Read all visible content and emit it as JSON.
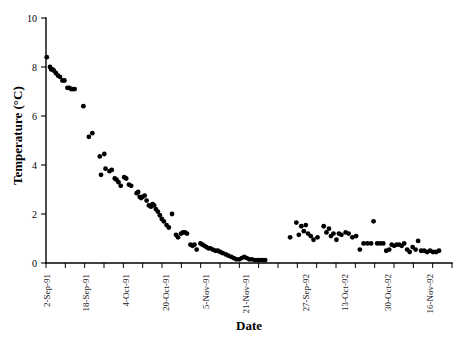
{
  "chart_data": {
    "type": "scatter",
    "title": "",
    "xlabel": "Date",
    "ylabel": "Temperature (°C)",
    "ylim": [
      0,
      10
    ],
    "yticks": [
      0,
      2,
      4,
      6,
      8,
      10
    ],
    "ytick_labels": [
      "0",
      "2",
      "4",
      "6",
      "8",
      "10"
    ],
    "grid": false,
    "legend": "none",
    "marker": "filled-circle",
    "marker_color": "#000000",
    "xtick_labels": [
      "2-Sep-91",
      "18-Sep-91",
      "4-Oct-91",
      "20-Oct-91",
      "5-Nov-91",
      "21-Nov-91",
      "27-Sep-92",
      "13-Oct-92",
      "30-Oct-92",
      "16-Nov-92"
    ],
    "xtick_positions": [
      0,
      16,
      32,
      48,
      64,
      80,
      104,
      120,
      137,
      154
    ],
    "xtick_minor_count": 21,
    "xaxis_note": "day index; gap between 1991 and 1992 sampling seasons",
    "series": [
      {
        "name": "Temperature",
        "points": [
          [
            0.3,
            8.4
          ],
          [
            1.6,
            8.0
          ],
          [
            2.1,
            7.9
          ],
          [
            2.6,
            7.9
          ],
          [
            3.2,
            7.85
          ],
          [
            4.0,
            7.75
          ],
          [
            4.8,
            7.65
          ],
          [
            5.6,
            7.6
          ],
          [
            6.6,
            7.45
          ],
          [
            7.4,
            7.45
          ],
          [
            8.6,
            7.15
          ],
          [
            9.4,
            7.15
          ],
          [
            10.1,
            7.1
          ],
          [
            10.8,
            7.1
          ],
          [
            11.5,
            7.1
          ],
          [
            15.0,
            6.4
          ],
          [
            17.2,
            5.15
          ],
          [
            18.6,
            5.3
          ],
          [
            21.6,
            4.35
          ],
          [
            23.4,
            4.45
          ],
          [
            23.9,
            3.85
          ],
          [
            22.1,
            3.6
          ],
          [
            25.5,
            3.75
          ],
          [
            26.4,
            3.8
          ],
          [
            27.6,
            3.45
          ],
          [
            28.3,
            3.4
          ],
          [
            29.1,
            3.3
          ],
          [
            30.0,
            3.15
          ],
          [
            31.4,
            3.5
          ],
          [
            32.2,
            3.45
          ],
          [
            33.3,
            3.2
          ],
          [
            34.2,
            3.15
          ],
          [
            36.4,
            2.85
          ],
          [
            37.0,
            2.9
          ],
          [
            37.6,
            2.7
          ],
          [
            38.2,
            2.65
          ],
          [
            38.8,
            2.7
          ],
          [
            39.6,
            2.75
          ],
          [
            40.4,
            2.55
          ],
          [
            41.3,
            2.35
          ],
          [
            42.1,
            2.3
          ],
          [
            42.8,
            2.4
          ],
          [
            43.4,
            2.35
          ],
          [
            44.1,
            2.2
          ],
          [
            44.9,
            2.1
          ],
          [
            45.7,
            1.95
          ],
          [
            46.5,
            1.8
          ],
          [
            47.3,
            1.7
          ],
          [
            48.4,
            1.55
          ],
          [
            49.3,
            1.45
          ],
          [
            50.6,
            2.0
          ],
          [
            52.2,
            1.15
          ],
          [
            53.0,
            1.05
          ],
          [
            54.2,
            1.2
          ],
          [
            55.0,
            1.25
          ],
          [
            55.8,
            1.25
          ],
          [
            56.6,
            1.2
          ],
          [
            58.0,
            0.75
          ],
          [
            58.8,
            0.7
          ],
          [
            59.6,
            0.75
          ],
          [
            60.5,
            0.55
          ],
          [
            62.0,
            0.8
          ],
          [
            62.8,
            0.75
          ],
          [
            63.6,
            0.7
          ],
          [
            64.4,
            0.65
          ],
          [
            65.2,
            0.6
          ],
          [
            66.0,
            0.6
          ],
          [
            67.0,
            0.55
          ],
          [
            68.0,
            0.5
          ],
          [
            69.0,
            0.5
          ],
          [
            70.0,
            0.45
          ],
          [
            71.0,
            0.4
          ],
          [
            72.2,
            0.35
          ],
          [
            73.2,
            0.3
          ],
          [
            74.4,
            0.25
          ],
          [
            75.4,
            0.2
          ],
          [
            76.4,
            0.15
          ],
          [
            77.6,
            0.15
          ],
          [
            78.6,
            0.2
          ],
          [
            79.6,
            0.25
          ],
          [
            80.6,
            0.2
          ],
          [
            81.6,
            0.15
          ],
          [
            82.6,
            0.15
          ],
          [
            83.8,
            0.12
          ],
          [
            85.0,
            0.12
          ],
          [
            86.0,
            0.12
          ],
          [
            87.0,
            0.12
          ],
          [
            88.0,
            0.12
          ],
          [
            98.0,
            1.05
          ],
          [
            100.5,
            1.65
          ],
          [
            101.5,
            1.15
          ],
          [
            102.5,
            1.5
          ],
          [
            103.5,
            1.3
          ],
          [
            104.3,
            1.55
          ],
          [
            105.2,
            1.2
          ],
          [
            106.3,
            1.1
          ],
          [
            107.4,
            0.95
          ],
          [
            109.0,
            1.05
          ],
          [
            111.5,
            1.5
          ],
          [
            112.6,
            1.25
          ],
          [
            113.6,
            1.4
          ],
          [
            114.4,
            1.1
          ],
          [
            115.4,
            1.2
          ],
          [
            116.6,
            0.95
          ],
          [
            117.6,
            1.2
          ],
          [
            118.6,
            1.15
          ],
          [
            120.3,
            1.25
          ],
          [
            121.5,
            1.2
          ],
          [
            123.0,
            1.05
          ],
          [
            124.5,
            1.1
          ],
          [
            126.0,
            0.55
          ],
          [
            127.5,
            0.8
          ],
          [
            129.0,
            0.8
          ],
          [
            130.5,
            0.8
          ],
          [
            131.5,
            1.7
          ],
          [
            133.0,
            0.8
          ],
          [
            134.2,
            0.8
          ],
          [
            135.4,
            0.8
          ],
          [
            136.6,
            0.5
          ],
          [
            137.8,
            0.55
          ],
          [
            138.8,
            0.75
          ],
          [
            139.8,
            0.7
          ],
          [
            140.8,
            0.75
          ],
          [
            141.8,
            0.75
          ],
          [
            142.8,
            0.7
          ],
          [
            143.8,
            0.8
          ],
          [
            145.0,
            0.55
          ],
          [
            146.0,
            0.45
          ],
          [
            147.2,
            0.65
          ],
          [
            148.4,
            0.55
          ],
          [
            149.4,
            0.9
          ],
          [
            150.6,
            0.5
          ],
          [
            151.8,
            0.5
          ],
          [
            153.0,
            0.45
          ],
          [
            154.2,
            0.5
          ],
          [
            155.4,
            0.45
          ],
          [
            156.6,
            0.45
          ],
          [
            157.8,
            0.5
          ]
        ]
      }
    ]
  },
  "axes": {
    "y_title": "Temperature (°C)",
    "x_title": "Date"
  }
}
